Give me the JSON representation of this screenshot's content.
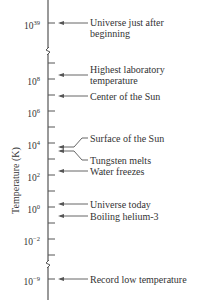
{
  "diagram": {
    "axis_title": "Temperature (K)",
    "axis_color": "#555555",
    "ticks": [
      {
        "y": 23,
        "label_base": "10",
        "label_exp": "39",
        "major": true
      },
      {
        "y": 63,
        "major": false
      },
      {
        "y": 79,
        "label_base": "10",
        "label_exp": "8",
        "major": true
      },
      {
        "y": 95,
        "major": false
      },
      {
        "y": 111,
        "label_base": "10",
        "label_exp": "6",
        "major": true
      },
      {
        "y": 127,
        "major": false
      },
      {
        "y": 143,
        "label_base": "10",
        "label_exp": "4",
        "major": true
      },
      {
        "y": 159,
        "major": false
      },
      {
        "y": 175,
        "label_base": "10",
        "label_exp": "2",
        "major": true
      },
      {
        "y": 191,
        "major": false
      },
      {
        "y": 207,
        "label_base": "10",
        "label_exp": "0",
        "major": true
      },
      {
        "y": 223,
        "major": false
      },
      {
        "y": 239,
        "label_base": "10",
        "label_exp": "−2",
        "major": true
      },
      {
        "y": 255,
        "major": false
      },
      {
        "y": 279,
        "label_base": "10",
        "label_exp": "−9",
        "major": true
      }
    ],
    "axis_breaks": [
      51,
      264
    ],
    "events": [
      {
        "label_lines": [
          "Universe just after",
          "beginning"
        ],
        "arrow_y": 23,
        "label_y": 17
      },
      {
        "label_lines": [
          "Highest laboratory",
          "temperature"
        ],
        "arrow_y": 75,
        "label_y": 64
      },
      {
        "label_lines": [
          "Center of the Sun"
        ],
        "arrow_y": 96,
        "label_y": 91
      },
      {
        "label_lines": [
          "Surface of the Sun"
        ],
        "arrow_y": 147,
        "label_y": 133,
        "elbow": true
      },
      {
        "label_lines": [
          "Tungsten melts"
        ],
        "arrow_y": 151,
        "label_y": 155,
        "elbow": true
      },
      {
        "label_lines": [
          "Water freezes"
        ],
        "arrow_y": 171,
        "label_y": 166
      },
      {
        "label_lines": [
          "Universe today"
        ],
        "arrow_y": 204,
        "label_y": 199
      },
      {
        "label_lines": [
          "Boiling helium-3"
        ],
        "arrow_y": 216,
        "label_y": 211
      },
      {
        "label_lines": [
          "Record low temperature"
        ],
        "arrow_y": 279,
        "label_y": 274
      }
    ]
  }
}
